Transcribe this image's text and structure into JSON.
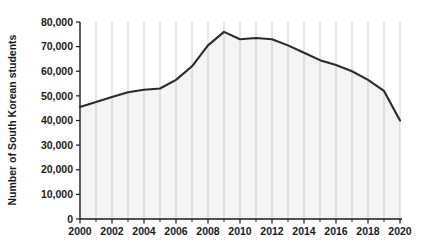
{
  "chart_data": {
    "type": "area",
    "title": "",
    "xlabel": "",
    "ylabel": "Number of South Korean students",
    "x": [
      2000,
      2001,
      2002,
      2003,
      2004,
      2005,
      2006,
      2007,
      2008,
      2009,
      2010,
      2011,
      2012,
      2013,
      2014,
      2015,
      2016,
      2017,
      2018,
      2019,
      2020
    ],
    "values": [
      45500,
      47500,
      49500,
      51500,
      52500,
      53000,
      56500,
      62000,
      70500,
      76000,
      73000,
      73500,
      73000,
      70500,
      67500,
      64500,
      62500,
      60000,
      56500,
      52000,
      40000
    ],
    "categories": [
      "2000",
      "2001",
      "2002",
      "2003",
      "2004",
      "2005",
      "2006",
      "2007",
      "2008",
      "2009",
      "2010",
      "2011",
      "2012",
      "2013",
      "2014",
      "2015",
      "2016",
      "2017",
      "2018",
      "2019",
      "2020"
    ],
    "xlim": [
      2000,
      2020
    ],
    "ylim": [
      0,
      80000
    ],
    "ytick_values": [
      0,
      10000,
      20000,
      30000,
      40000,
      50000,
      60000,
      70000,
      80000
    ],
    "ytick_labels": [
      "0",
      "10,000",
      "20,000",
      "30,000",
      "40,000",
      "50,000",
      "60,000",
      "70,000",
      "80,000"
    ],
    "xtick_values": [
      2000,
      2002,
      2004,
      2006,
      2008,
      2010,
      2012,
      2014,
      2016,
      2018,
      2020
    ],
    "xtick_labels": [
      "2000",
      "2002",
      "2004",
      "2006",
      "2008",
      "2010",
      "2012",
      "2014",
      "2016",
      "2018",
      "2020"
    ],
    "minor_xticks_every": 1,
    "grid": "vertical-only",
    "legend": "none",
    "colors": {
      "line": "#2a2a2a",
      "fill": "#f4f4f4",
      "gridline": "#b8b8b8",
      "axis": "#1a1a1a",
      "background": "#ffffff"
    }
  }
}
